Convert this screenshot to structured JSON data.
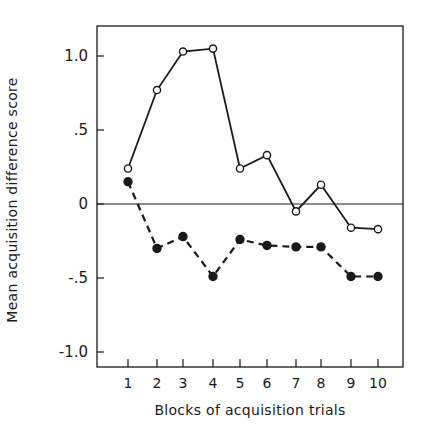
{
  "chart_data": {
    "type": "line",
    "title": "",
    "xlabel": "Blocks of acquisition trials",
    "ylabel": "Mean acquisition difference score",
    "x": [
      1,
      2,
      3,
      4,
      5,
      6,
      7,
      8,
      9,
      10
    ],
    "x_tick_labels": [
      "1",
      "2",
      "3",
      "4",
      "5",
      "6",
      "7",
      "8",
      "9",
      "10"
    ],
    "y_ticks": [
      1.0,
      0.5,
      0,
      -0.5,
      -1.0
    ],
    "y_tick_labels": [
      "1.0",
      ".5",
      "0",
      "-.5",
      "-1.0"
    ],
    "ylim": [
      -1.12,
      1.2
    ],
    "xlim": [
      0,
      11.3
    ],
    "grid": false,
    "reference_line": 0,
    "legend": null,
    "series": [
      {
        "name": "open circles (solid line)",
        "marker": "open-circle",
        "line": "solid",
        "values": [
          0.24,
          0.77,
          1.03,
          1.05,
          0.24,
          0.33,
          -0.05,
          0.13,
          -0.16,
          -0.17
        ]
      },
      {
        "name": "filled circles (dashed line)",
        "marker": "filled-circle",
        "line": "dashed",
        "values": [
          0.15,
          -0.3,
          -0.22,
          -0.49,
          -0.24,
          -0.28,
          -0.29,
          -0.29,
          -0.49,
          -0.49
        ]
      }
    ]
  },
  "colors": {
    "ink": "#1a1a1a",
    "background": "#ffffff"
  }
}
